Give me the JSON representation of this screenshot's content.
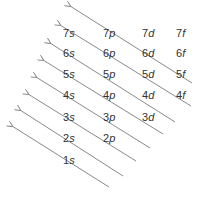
{
  "diagram": {
    "title": "",
    "line_color": "#8a8a8a",
    "text_color": "#333333",
    "orbitals": [
      {
        "n": "7",
        "l": "s",
        "x": 63,
        "y": 28
      },
      {
        "n": "7",
        "l": "p",
        "x": 103,
        "y": 28
      },
      {
        "n": "7",
        "l": "d",
        "x": 142,
        "y": 28
      },
      {
        "n": "7",
        "l": "f",
        "x": 176,
        "y": 28
      },
      {
        "n": "6",
        "l": "s",
        "x": 63,
        "y": 48
      },
      {
        "n": "6",
        "l": "p",
        "x": 103,
        "y": 48
      },
      {
        "n": "6",
        "l": "d",
        "x": 142,
        "y": 48
      },
      {
        "n": "6",
        "l": "f",
        "x": 176,
        "y": 48
      },
      {
        "n": "5",
        "l": "s",
        "x": 63,
        "y": 69
      },
      {
        "n": "5",
        "l": "p",
        "x": 103,
        "y": 69
      },
      {
        "n": "5",
        "l": "d",
        "x": 142,
        "y": 69
      },
      {
        "n": "5",
        "l": "f",
        "x": 176,
        "y": 69
      },
      {
        "n": "4",
        "l": "s",
        "x": 63,
        "y": 90
      },
      {
        "n": "4",
        "l": "p",
        "x": 103,
        "y": 90
      },
      {
        "n": "4",
        "l": "d",
        "x": 142,
        "y": 90
      },
      {
        "n": "4",
        "l": "f",
        "x": 176,
        "y": 90
      },
      {
        "n": "3",
        "l": "s",
        "x": 63,
        "y": 112
      },
      {
        "n": "3",
        "l": "p",
        "x": 103,
        "y": 112
      },
      {
        "n": "3",
        "l": "d",
        "x": 142,
        "y": 112
      },
      {
        "n": "2",
        "l": "s",
        "x": 63,
        "y": 133
      },
      {
        "n": "2",
        "l": "p",
        "x": 103,
        "y": 133
      },
      {
        "n": "1",
        "l": "s",
        "x": 63,
        "y": 155
      }
    ],
    "arrows": [
      {
        "x1": 192,
        "y1": 83,
        "x2": 70,
        "y2": 6
      },
      {
        "x1": 191,
        "y1": 106,
        "x2": 60,
        "y2": 25
      },
      {
        "x1": 175,
        "y1": 122,
        "x2": 50,
        "y2": 43
      },
      {
        "x1": 163,
        "y1": 134,
        "x2": 43,
        "y2": 60
      },
      {
        "x1": 150,
        "y1": 148,
        "x2": 36,
        "y2": 77
      },
      {
        "x1": 136,
        "y1": 161,
        "x2": 28,
        "y2": 94
      },
      {
        "x1": 123,
        "y1": 176,
        "x2": 20,
        "y2": 110
      },
      {
        "x1": 109,
        "y1": 187,
        "x2": 12,
        "y2": 126
      }
    ]
  }
}
